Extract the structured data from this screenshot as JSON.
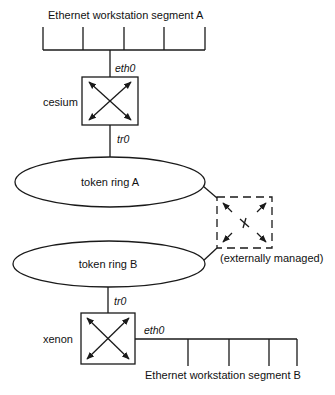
{
  "diagram": {
    "type": "network-topology",
    "segment_a": {
      "label": "Ethernet workstation segment A",
      "drop_count": 5
    },
    "cesium": {
      "name": "cesium",
      "top_interface": "eth0",
      "bottom_interface": "tr0",
      "icon": "router-cross-arrows-icon"
    },
    "ring_a": {
      "label": "token ring A"
    },
    "external_router": {
      "note": "(externally managed)",
      "icon": "router-cross-arrows-icon",
      "style": "dashed"
    },
    "ring_b": {
      "label": "token ring B"
    },
    "xenon": {
      "name": "xenon",
      "top_interface": "tr0",
      "side_interface": "eth0",
      "icon": "router-cross-arrows-icon"
    },
    "segment_b": {
      "label": "Ethernet workstation segment B",
      "drop_count": 4
    },
    "colors": {
      "line": "#1a1a1a",
      "background": "#ffffff"
    }
  }
}
